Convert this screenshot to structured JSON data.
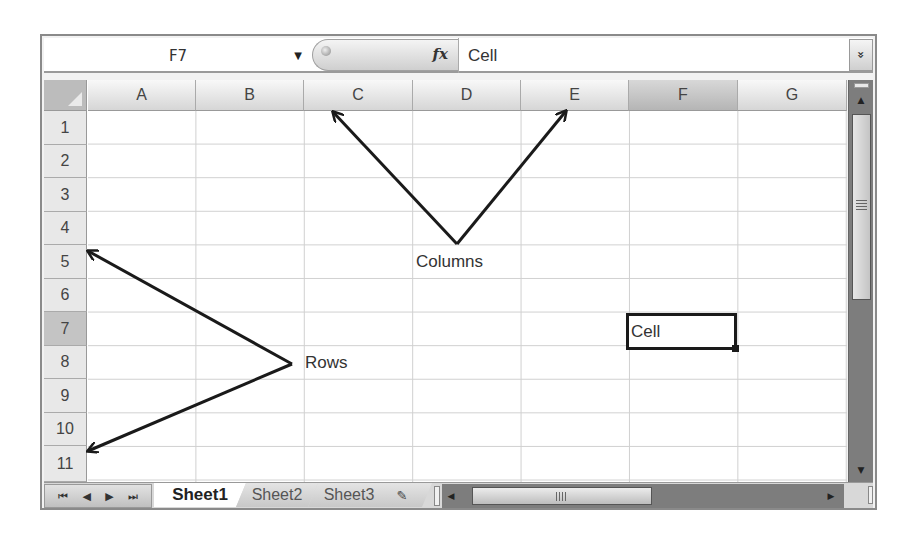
{
  "formula_bar": {
    "name_box": "F7",
    "name_box_dropdown_icon": "▼",
    "fx_icon": "fx",
    "formula_value": "Cell",
    "expand_icon": "»"
  },
  "grid": {
    "columns": [
      "A",
      "B",
      "C",
      "D",
      "E",
      "F",
      "G"
    ],
    "rows": [
      "1",
      "2",
      "3",
      "4",
      "5",
      "6",
      "7",
      "8",
      "9",
      "10",
      "11"
    ],
    "active_column": "F",
    "active_row": "7",
    "active_cell": {
      "ref": "F7",
      "value": "Cell"
    }
  },
  "annotations": {
    "columns_label": "Columns",
    "rows_label": "Rows"
  },
  "sheet_tabs": {
    "nav": {
      "first": "⏮",
      "prev": "◀",
      "next": "▶",
      "last": "⏭"
    },
    "tabs": [
      {
        "label": "Sheet1",
        "active": true
      },
      {
        "label": "Sheet2",
        "active": false
      },
      {
        "label": "Sheet3",
        "active": false
      }
    ],
    "new_sheet_icon": "✎"
  },
  "colors": {
    "frame": "#8a8a8a",
    "header_bg": "#d6d6d6",
    "active_header_bg": "#b5b5b5",
    "gridline": "#d0d0d0",
    "active_cell_border": "#1a1a1a",
    "scrollbar_bg": "#7d7d7d"
  }
}
